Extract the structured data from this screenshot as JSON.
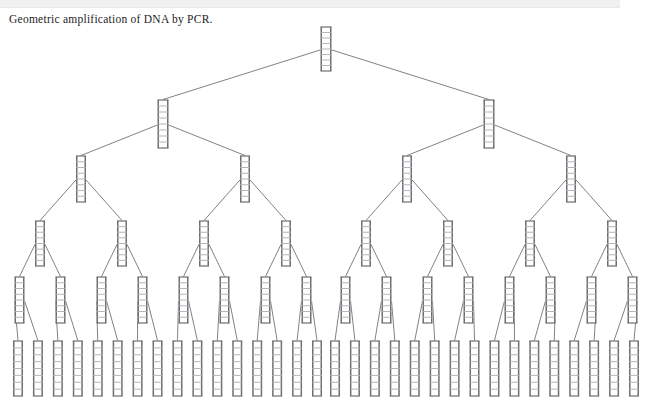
{
  "figure": {
    "caption": "Geometric amplification of DNA by PCR.",
    "type": "binary-tree-diagram",
    "node_icon": "dna-ladder-icon",
    "colors": {
      "background": "#ffffff",
      "top_band": "#f0f0f0",
      "caption_text": "#1d1d1d",
      "edge_line": "#58585c",
      "ladder_rail": "#6e6e73",
      "ladder_rung": "#adadb2"
    }
  },
  "tree": {
    "levels": 6,
    "branching_factor": 2,
    "counts": [
      1,
      2,
      4,
      8,
      16,
      32
    ],
    "total_nodes": 63,
    "level_labels": [
      "Cycle 0",
      "Cycle 1",
      "Cycle 2",
      "Cycle 3",
      "Cycle 4",
      "Cycle 5"
    ],
    "geometry": {
      "level_y": [
        27,
        100,
        156,
        221,
        277,
        341
      ],
      "ladder_width": [
        11,
        11,
        10,
        10,
        10,
        10
      ],
      "ladder_height": [
        44,
        48,
        46,
        45,
        46,
        55
      ],
      "rungs": [
        8,
        8,
        8,
        8,
        8,
        8
      ],
      "span_left": [
        326,
        163,
        82,
        41,
        20.5,
        10.25
      ],
      "root_x": 326,
      "margin_x": 18
    }
  }
}
